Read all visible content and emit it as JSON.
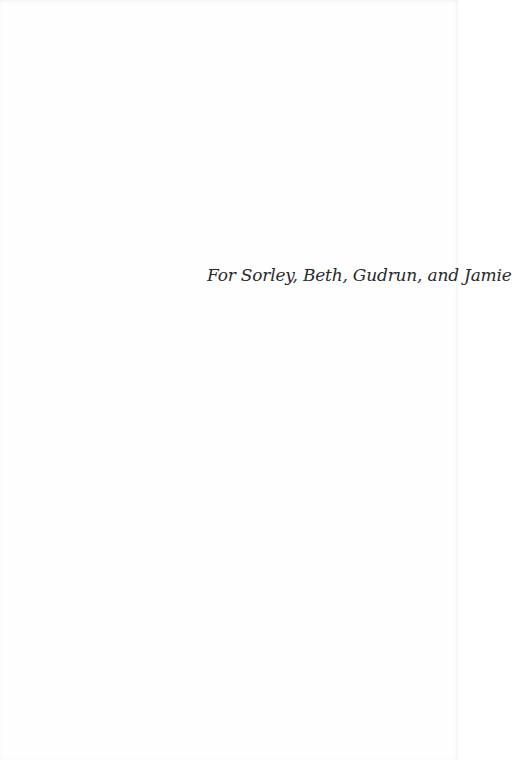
{
  "page": {
    "dedication": "For Sorley, Beth, Gudrun, and Jamie"
  },
  "colors": {
    "background": "#fefefe",
    "text": "#2a2a2a"
  }
}
